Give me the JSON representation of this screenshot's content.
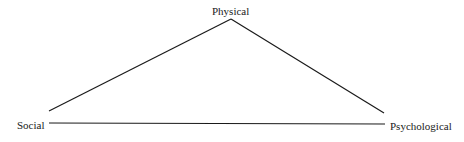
{
  "diagram": {
    "type": "triangle",
    "nodes": {
      "top": {
        "label": "Physical"
      },
      "left": {
        "label": "Social"
      },
      "right": {
        "label": "Psychological"
      }
    },
    "edges": [
      {
        "from": "Physical",
        "to": "Social"
      },
      {
        "from": "Physical",
        "to": "Psychological"
      },
      {
        "from": "Social",
        "to": "Psychological"
      }
    ],
    "line_color": "#1a1a1a",
    "background_color": "#ffffff"
  }
}
